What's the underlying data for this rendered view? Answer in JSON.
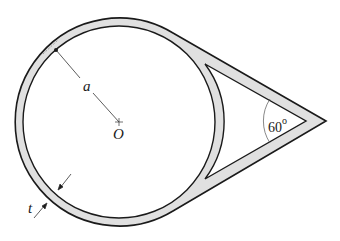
{
  "diagram": {
    "labels": {
      "radius": "a",
      "center": "O",
      "thickness": "t",
      "angle": "60",
      "angle_unit": "o"
    },
    "colors": {
      "wall_fill": "#e0e0e0",
      "stroke": "#1a1a1a",
      "background": "#ffffff"
    }
  }
}
